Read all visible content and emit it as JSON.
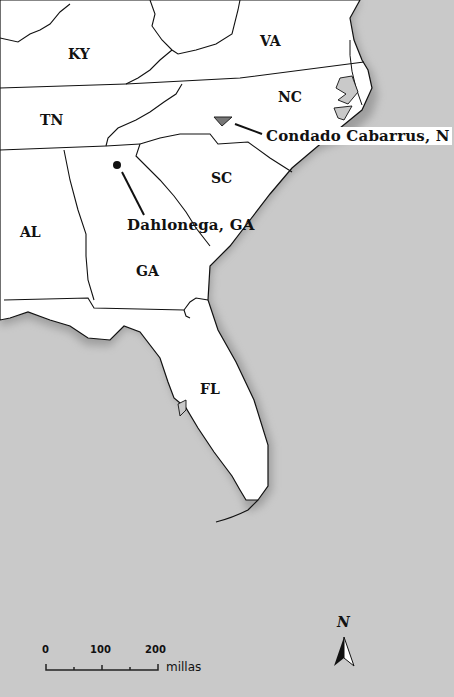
{
  "map": {
    "background_color": "#c9c9c9",
    "land_color": "#ffffff",
    "states": [
      {
        "abbr": "KY",
        "x": 68,
        "y": 46
      },
      {
        "abbr": "VA",
        "x": 260,
        "y": 33
      },
      {
        "abbr": "TN",
        "x": 40,
        "y": 112
      },
      {
        "abbr": "NC",
        "x": 278,
        "y": 89
      },
      {
        "abbr": "SC",
        "x": 211,
        "y": 170
      },
      {
        "abbr": "AL",
        "x": 20,
        "y": 224
      },
      {
        "abbr": "GA",
        "x": 136,
        "y": 263
      },
      {
        "abbr": "FL",
        "x": 200,
        "y": 381
      }
    ],
    "places": [
      {
        "name": "Condado Cabarrus, N",
        "marker": "triangle",
        "label_x": 266,
        "label_y": 128
      },
      {
        "name": "Dahlonega, GA",
        "marker": "dot",
        "label_x": 126,
        "label_y": 217
      }
    ]
  },
  "scale_bar": {
    "ticks": [
      "0",
      "100",
      "200"
    ],
    "units": "millas"
  },
  "north_arrow": {
    "label": "N"
  }
}
